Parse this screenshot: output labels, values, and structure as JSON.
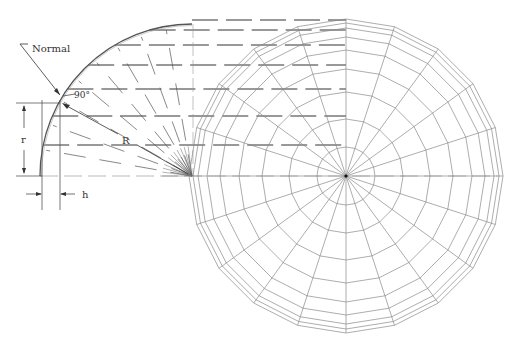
{
  "diagram": {
    "colors": {
      "line": "#555555",
      "light_line": "#8a8a8a",
      "dash": "#333333",
      "background": "#ffffff"
    },
    "labels": {
      "normal": "Normal",
      "angle": "90°",
      "R": "R",
      "r": "r",
      "h": "h"
    },
    "profile": {
      "center": [
        192,
        176
      ],
      "radius": 152,
      "start_angle_deg": 180,
      "end_angle_deg": 90,
      "ray_count": 9,
      "vertical_lines_x": [
        42,
        60
      ],
      "r_top_y": 103,
      "baseline_y": 176
    },
    "plan": {
      "center": [
        346,
        176
      ],
      "sides": 20,
      "ring_radii": [
        29,
        57,
        84,
        107,
        126,
        139,
        148,
        153
      ],
      "outer_ring_offset": 4
    },
    "projection_lines_y": [
      20,
      30,
      45,
      65,
      89,
      116,
      145,
      176
    ]
  }
}
